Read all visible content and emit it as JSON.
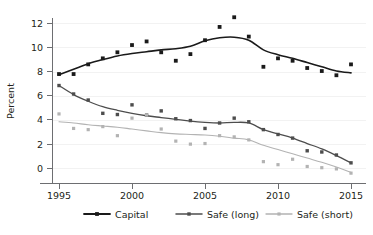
{
  "chart_data": {
    "type": "scatter",
    "title": "",
    "subtitle": "",
    "xlabel": "",
    "ylabel": "Percent",
    "xlim": [
      1994.2,
      2015.8
    ],
    "ylim": [
      -1.0,
      13.0
    ],
    "xticks": [
      1995,
      2000,
      2005,
      2010,
      2015
    ],
    "yticks": [
      0,
      2,
      4,
      6,
      8,
      10,
      12
    ],
    "xtick_labels": [
      "1995",
      "2000",
      "2005",
      "2010",
      "2015"
    ],
    "ytick_labels": [
      "0",
      "2",
      "4",
      "6",
      "8",
      "10",
      "12"
    ],
    "grid": "horizontal",
    "legend_position": "bottom",
    "x": [
      1995,
      1996,
      1997,
      1998,
      1999,
      2000,
      2001,
      2002,
      2003,
      2004,
      2005,
      2006,
      2007,
      2008,
      2009,
      2010,
      2011,
      2012,
      2013,
      2014,
      2015
    ],
    "series": [
      {
        "name": "Capital",
        "color": "#1a1a1a",
        "marker": "square",
        "values": [
          7.8,
          7.8,
          8.6,
          9.1,
          9.6,
          10.2,
          10.5,
          9.6,
          8.9,
          9.45,
          10.6,
          11.7,
          12.5,
          10.9,
          8.4,
          9.1,
          8.9,
          8.3,
          8.05,
          7.7,
          8.6
        ],
        "smooth": [
          7.75,
          8.2,
          8.65,
          9.0,
          9.3,
          9.5,
          9.65,
          9.8,
          9.9,
          10.1,
          10.55,
          10.8,
          10.85,
          10.6,
          9.8,
          9.4,
          9.1,
          8.75,
          8.4,
          8.05,
          7.9
        ]
      },
      {
        "name": "Safe (long)",
        "color": "#4d4d4d",
        "marker": "square",
        "values": [
          6.85,
          6.15,
          5.65,
          4.55,
          4.45,
          5.25,
          4.4,
          4.75,
          4.1,
          3.95,
          3.3,
          3.75,
          4.15,
          3.85,
          3.2,
          2.8,
          2.5,
          1.45,
          1.35,
          1.1,
          0.45
        ],
        "smooth": [
          6.85,
          6.1,
          5.55,
          5.1,
          4.8,
          4.55,
          4.35,
          4.2,
          4.05,
          3.9,
          3.8,
          3.75,
          3.8,
          3.75,
          3.2,
          2.85,
          2.5,
          2.05,
          1.6,
          1.05,
          0.45
        ]
      },
      {
        "name": "Safe (short)",
        "color": "#b3b3b3",
        "marker": "square",
        "values": [
          4.5,
          3.3,
          3.2,
          3.45,
          2.7,
          4.15,
          4.4,
          3.25,
          2.25,
          2.0,
          2.05,
          2.7,
          2.6,
          2.35,
          0.55,
          0.3,
          0.75,
          0.15,
          0.05,
          -0.05,
          -0.4
        ],
        "smooth": [
          3.85,
          3.75,
          3.6,
          3.5,
          3.4,
          3.25,
          3.1,
          2.95,
          2.85,
          2.8,
          2.75,
          2.65,
          2.5,
          2.35,
          1.9,
          1.55,
          1.2,
          0.85,
          0.5,
          0.1,
          -0.35
        ]
      }
    ],
    "legend": [
      {
        "label": "Capital",
        "color": "#1a1a1a"
      },
      {
        "label": "Safe (long)",
        "color": "#4d4d4d"
      },
      {
        "label": "Safe (short)",
        "color": "#b3b3b3"
      }
    ]
  }
}
